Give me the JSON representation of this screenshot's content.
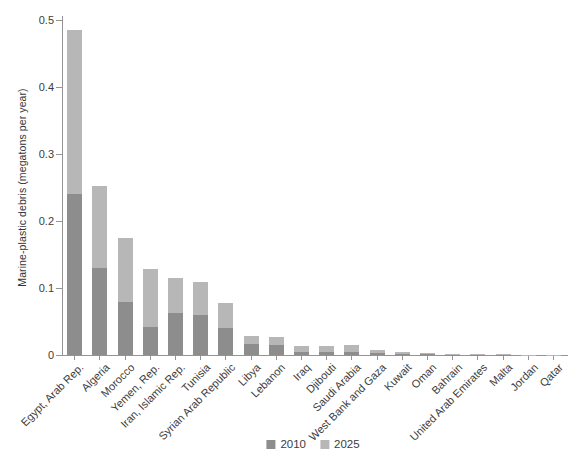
{
  "chart_data": {
    "type": "bar",
    "stacked": true,
    "title": "",
    "xlabel": "",
    "ylabel": "Marine-plastic debris (megatons per year)",
    "ylim": [
      0,
      0.5
    ],
    "yticks": [
      0,
      0.1,
      0.2,
      0.3,
      0.4,
      0.5
    ],
    "ytick_labels": [
      "0",
      "0.1",
      "0.2",
      "0.3",
      "0.4",
      "0.5"
    ],
    "grid": false,
    "legend_position": "bottom-center",
    "categories": [
      "Egypt, Arab Rep.",
      "Algeria",
      "Morocco",
      "Yemen, Rep.",
      "Iran, Islamic Rep.",
      "Tunisia",
      "Syrian Arab Republic",
      "Libya",
      "Lebanon",
      "Iraq",
      "Djibouti",
      "Saudi Arabia",
      "West Bank and Gaza",
      "Kuwait",
      "Oman",
      "Bahrain",
      "United Arab Emirates",
      "Malta",
      "Jordan",
      "Qatar"
    ],
    "series": [
      {
        "name": "2010",
        "color": "#8d8d8d",
        "values": [
          0.24,
          0.13,
          0.079,
          0.042,
          0.063,
          0.059,
          0.041,
          0.016,
          0.015,
          0.005,
          0.005,
          0.005,
          0.003,
          0.002,
          0.001,
          0.0006,
          0.0004,
          0.0003,
          0.0002,
          0.0002
        ]
      },
      {
        "name": "2025",
        "color": "#b7b7b7",
        "note": "values are the 2025 bar-top totals; drawn as a light segment stacked above the 2010 portion",
        "values": [
          0.485,
          0.253,
          0.175,
          0.128,
          0.115,
          0.109,
          0.077,
          0.029,
          0.027,
          0.013,
          0.014,
          0.015,
          0.008,
          0.004,
          0.003,
          0.0016,
          0.001,
          0.0008,
          0.0006,
          0.0005
        ]
      }
    ],
    "axis_color": "#949494",
    "text_color": "#3c3c3c",
    "background_color": "#ffffff"
  },
  "legend": {
    "items": [
      {
        "label": "2010",
        "color": "#8d8d8d"
      },
      {
        "label": "2025",
        "color": "#b7b7b7"
      }
    ]
  }
}
